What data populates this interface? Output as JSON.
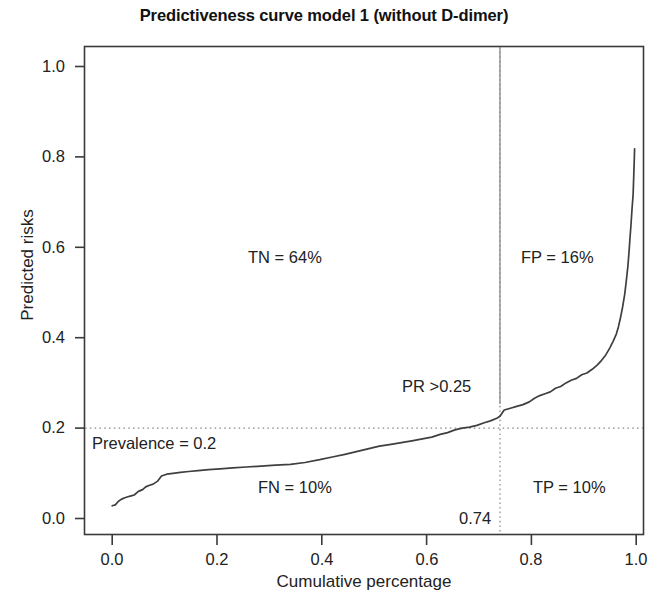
{
  "chart_data": {
    "type": "line",
    "title": "Predictiveness curve model 1 (without D-dimer)",
    "xlabel": "Cumulative percentage",
    "ylabel": "Predicted risks",
    "xlim": [
      0.0,
      1.0
    ],
    "ylim": [
      0.0,
      1.0
    ],
    "grid": false,
    "legend": "none",
    "xticks": [
      "0.0",
      "0.2",
      "0.4",
      "0.6",
      "0.8",
      "1.0"
    ],
    "xtick_values": [
      0.0,
      0.2,
      0.4,
      0.6,
      0.8,
      1.0
    ],
    "yticks": [
      "1.0",
      "0.8",
      "0.6",
      "0.4",
      "0.2",
      "0.0"
    ],
    "ytick_values": [
      1.0,
      0.8,
      0.6,
      0.4,
      0.2,
      0.0
    ],
    "series": [
      {
        "name": "Predictiveness curve",
        "color": "#3f3f3f",
        "x": [
          0.0,
          0.006,
          0.012,
          0.018,
          0.024,
          0.03,
          0.036,
          0.042,
          0.05,
          0.058,
          0.064,
          0.07,
          0.078,
          0.086,
          0.094,
          0.104,
          0.116,
          0.13,
          0.146,
          0.164,
          0.184,
          0.206,
          0.23,
          0.256,
          0.284,
          0.312,
          0.34,
          0.368,
          0.396,
          0.42,
          0.444,
          0.466,
          0.488,
          0.51,
          0.532,
          0.552,
          0.572,
          0.592,
          0.61,
          0.626,
          0.64,
          0.654,
          0.668,
          0.682,
          0.696,
          0.71,
          0.722,
          0.734,
          0.74,
          0.748,
          0.76,
          0.772,
          0.784,
          0.796,
          0.806,
          0.816,
          0.826,
          0.836,
          0.846,
          0.856,
          0.866,
          0.876,
          0.886,
          0.896,
          0.906,
          0.916,
          0.926,
          0.934,
          0.942,
          0.95,
          0.956,
          0.962,
          0.966,
          0.97,
          0.974,
          0.978,
          0.981,
          0.984,
          0.986,
          0.988,
          0.99,
          0.992,
          0.994,
          0.995,
          0.996,
          0.997
        ],
        "y": [
          0.028,
          0.03,
          0.038,
          0.043,
          0.046,
          0.048,
          0.05,
          0.052,
          0.06,
          0.064,
          0.07,
          0.073,
          0.076,
          0.082,
          0.094,
          0.098,
          0.1,
          0.102,
          0.104,
          0.106,
          0.108,
          0.11,
          0.112,
          0.114,
          0.116,
          0.118,
          0.12,
          0.124,
          0.13,
          0.136,
          0.142,
          0.148,
          0.154,
          0.16,
          0.164,
          0.168,
          0.172,
          0.176,
          0.18,
          0.186,
          0.19,
          0.196,
          0.2,
          0.202,
          0.206,
          0.212,
          0.216,
          0.222,
          0.226,
          0.24,
          0.244,
          0.248,
          0.252,
          0.258,
          0.266,
          0.272,
          0.276,
          0.28,
          0.288,
          0.292,
          0.3,
          0.306,
          0.31,
          0.318,
          0.322,
          0.33,
          0.34,
          0.35,
          0.362,
          0.378,
          0.392,
          0.408,
          0.424,
          0.444,
          0.468,
          0.496,
          0.524,
          0.556,
          0.586,
          0.618,
          0.65,
          0.684,
          0.716,
          0.748,
          0.782,
          0.818
        ]
      }
    ],
    "reference_lines": [
      {
        "name": "prevalence-line",
        "orientation": "horizontal",
        "value": 0.2,
        "style": "dotted",
        "label": "Prevalence = 0.2"
      },
      {
        "name": "risk-threshold-line",
        "orientation": "vertical",
        "value": 0.74,
        "style": "dotted-solid",
        "label": "0.74"
      }
    ],
    "annotations": [
      {
        "name": "tn-label",
        "text": "TN = 64%",
        "x": 0.38,
        "y": 0.62
      },
      {
        "name": "fp-label",
        "text": "FP = 16%",
        "x": 0.85,
        "y": 0.62
      },
      {
        "name": "pr-threshold-label",
        "text": "PR >0.25",
        "x": 0.64,
        "y": 0.295
      },
      {
        "name": "prevalence-label",
        "text": "Prevalence = 0.2",
        "x": 0.1,
        "y": 0.165
      },
      {
        "name": "fn-label",
        "text": "FN = 10%",
        "x": 0.44,
        "y": 0.075
      },
      {
        "name": "tp-label",
        "text": "TP = 10%",
        "x": 0.9,
        "y": 0.075
      },
      {
        "name": "threshold-value-label",
        "text": "0.74",
        "x": 0.715,
        "y": 0.018
      }
    ]
  },
  "figure": {
    "title": "Predictiveness curve model 1 (without D-dimer)",
    "xlabel": "Cumulative percentage",
    "ylabel": "Predicted risks",
    "xticks": [
      "0.0",
      "0.2",
      "0.4",
      "0.6",
      "0.8",
      "1.0"
    ],
    "yticks": [
      "1.0",
      "0.8",
      "0.6",
      "0.4",
      "0.2",
      "0.0"
    ],
    "annotations": {
      "tn": "TN = 64%",
      "fp": "FP = 16%",
      "pr": "PR >0.25",
      "prevalence": "Prevalence = 0.2",
      "fn": "FN = 10%",
      "tp": "TP = 10%",
      "threshold": "0.74"
    },
    "colors": {
      "curve": "#3f3f3f",
      "axis": "#3a3a3a",
      "reference": "#8c8c8c",
      "text": "#1a1a1a",
      "background": "#ffffff"
    }
  }
}
